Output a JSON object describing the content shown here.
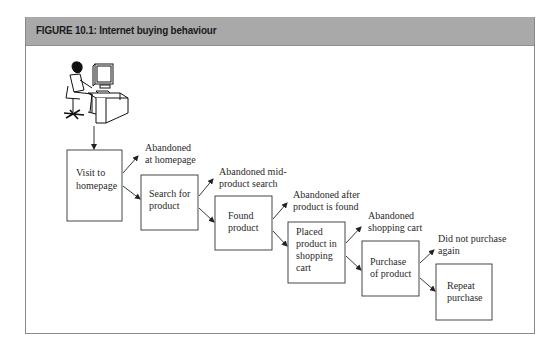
{
  "figure": {
    "title": "FIGURE 10.1: Internet buying behaviour",
    "header_color": "#a9a9a9",
    "border_color": "#8a8a8a"
  },
  "illustration": {
    "name": "person-at-computer",
    "description": "Person seated at desk using a computer"
  },
  "steps": [
    {
      "lines": [
        "Visit to",
        "homepage"
      ]
    },
    {
      "lines": [
        "Search for",
        "product"
      ]
    },
    {
      "lines": [
        "Found",
        "product"
      ]
    },
    {
      "lines": [
        "Placed",
        "product in",
        "shopping",
        "cart"
      ]
    },
    {
      "lines": [
        "Purchase",
        "of product"
      ]
    },
    {
      "lines": [
        "Repeat",
        "purchase"
      ]
    }
  ],
  "exits": [
    {
      "lines": [
        "Abandoned",
        "at homepage"
      ]
    },
    {
      "lines": [
        "Abandoned mid-",
        "product search"
      ]
    },
    {
      "lines": [
        "Abandoned after",
        "product is found"
      ]
    },
    {
      "lines": [
        "Abandoned",
        "shopping cart"
      ]
    },
    {
      "lines": [
        "Did not purchase",
        "again"
      ]
    }
  ]
}
